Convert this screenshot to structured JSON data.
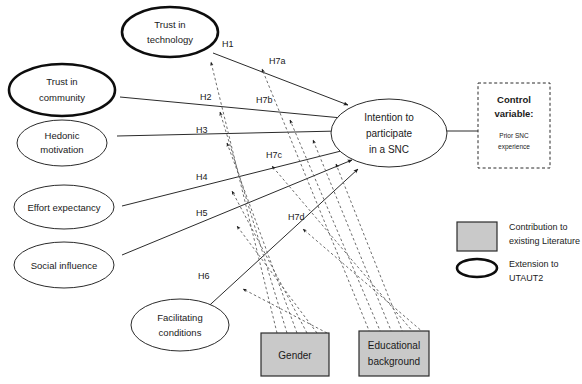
{
  "figure": {
    "type": "conceptual-research-model-diagram",
    "background_color": "#ffffff",
    "accent_gray": "#c9c9c9",
    "stroke_color": "#2b2b2b"
  },
  "constructs": [
    {
      "id": "trust-technology",
      "label_line1": "Trust in",
      "label_line2": "technology",
      "emphasis": "bold",
      "shape": "ellipse"
    },
    {
      "id": "trust-community",
      "label_line1": "Trust in",
      "label_line2": "community",
      "emphasis": "bold",
      "shape": "ellipse"
    },
    {
      "id": "hedonic-motivation",
      "label_line1": "Hedonic",
      "label_line2": "motivation",
      "emphasis": "plain",
      "shape": "ellipse"
    },
    {
      "id": "effort-expectancy",
      "label_line1": "Effort expectancy",
      "label_line2": "",
      "emphasis": "plain",
      "shape": "ellipse"
    },
    {
      "id": "social-influence",
      "label_line1": "Social influence",
      "label_line2": "",
      "emphasis": "plain",
      "shape": "ellipse"
    },
    {
      "id": "facilitating-conditions",
      "label_line1": "Facilitating",
      "label_line2": "conditions",
      "emphasis": "plain",
      "shape": "ellipse"
    }
  ],
  "outcome": {
    "id": "intention-participate",
    "label_line1": "Intention to",
    "label_line2": "participate",
    "label_line3": "in a SNC",
    "shape": "ellipse"
  },
  "moderators": [
    {
      "id": "gender",
      "label_line1": "Gender",
      "label_line2": "",
      "shape": "rect",
      "fill": "#c9c9c9"
    },
    {
      "id": "education",
      "label_line1": "Educational",
      "label_line2": "background",
      "shape": "rect",
      "fill": "#c9c9c9"
    }
  ],
  "control_variable": {
    "id": "control-variable",
    "title_line1": "Control",
    "title_line2": "variable:",
    "subtitle_line1": "Prior SNC",
    "subtitle_line2": "experience",
    "border": "dashed"
  },
  "hypotheses": [
    {
      "id": "H1",
      "label": "H1",
      "from": "trust-technology",
      "to": "intention-participate",
      "style": "solid",
      "x": 222,
      "y": 45
    },
    {
      "id": "H2",
      "label": "H2",
      "from": "trust-community",
      "to": "intention-participate",
      "style": "solid",
      "x": 200,
      "y": 98
    },
    {
      "id": "H3",
      "label": "H3",
      "from": "hedonic-motivation",
      "to": "intention-participate",
      "style": "solid",
      "x": 196,
      "y": 131
    },
    {
      "id": "H4",
      "label": "H4",
      "from": "effort-expectancy",
      "to": "intention-participate",
      "style": "solid",
      "x": 196,
      "y": 178
    },
    {
      "id": "H5",
      "label": "H5",
      "from": "social-influence",
      "to": "intention-participate",
      "style": "solid",
      "x": 196,
      "y": 214
    },
    {
      "id": "H6",
      "label": "H6",
      "from": "facilitating-conditions",
      "to": "intention-participate",
      "style": "solid",
      "x": 198,
      "y": 277
    },
    {
      "id": "H7a",
      "label": "H7a",
      "from": "gender",
      "to": "path-H1",
      "style": "dotted",
      "x": 269,
      "y": 62
    },
    {
      "id": "H7b",
      "label": "H7b",
      "from": "gender",
      "to": "path-H2",
      "style": "dotted",
      "x": 256,
      "y": 101
    },
    {
      "id": "H7c",
      "label": "H7c",
      "from": "education",
      "to": "path-H4",
      "style": "dotted",
      "x": 266,
      "y": 156
    },
    {
      "id": "H7d",
      "label": "H7d",
      "from": "education",
      "to": "path-H6",
      "style": "dotted",
      "x": 288,
      "y": 218
    }
  ],
  "legend": {
    "items": [
      {
        "id": "legend-rect",
        "swatch": "rect",
        "line1": "Contribution to",
        "line2": "existing Literature"
      },
      {
        "id": "legend-ellipse",
        "swatch": "ellipse",
        "line1": "Extension to",
        "line2": "UTAUT2"
      }
    ]
  }
}
